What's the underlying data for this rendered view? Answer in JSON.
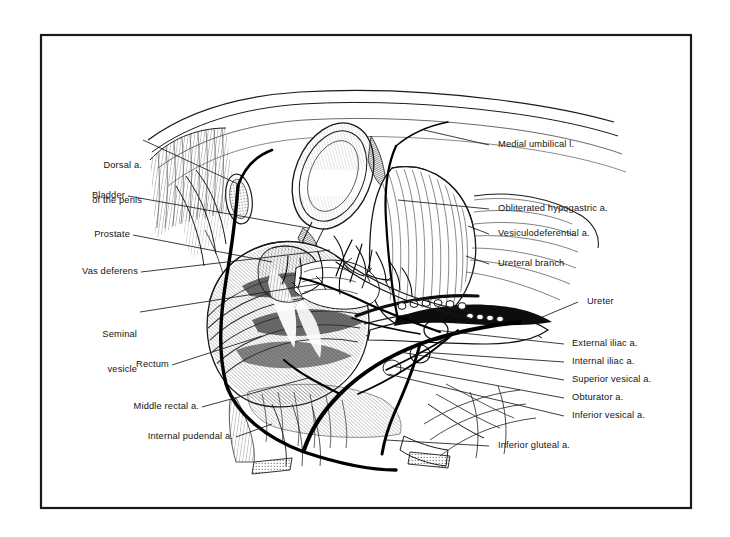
{
  "figure": {
    "kind": "anatomical-line-illustration",
    "frame": {
      "color": "#1a1a1a",
      "background": "#ffffff"
    },
    "ink": {
      "line": "#1a1a1a",
      "hatch": "#4a4a4a",
      "vessel": "#000000"
    }
  },
  "labels_left": [
    {
      "id": "dorsal-artery-of-penis",
      "text": "Dorsal a.\nof the penis",
      "lines": [
        "Dorsal a.",
        "of the penis"
      ]
    },
    {
      "id": "bladder",
      "text": "Bladder",
      "lines": [
        "Bladder"
      ]
    },
    {
      "id": "prostate",
      "text": "Prostate",
      "lines": [
        "Prostate"
      ]
    },
    {
      "id": "vas-deferens",
      "text": "Vas deferens",
      "lines": [
        "Vas deferens"
      ]
    },
    {
      "id": "seminal-vesicle",
      "text": "Seminal\nvesicle",
      "lines": [
        "Seminal",
        "vesicle"
      ]
    },
    {
      "id": "rectum",
      "text": "Rectum",
      "lines": [
        "Rectum"
      ]
    },
    {
      "id": "middle-rectal-artery",
      "text": "Middle rectal a.",
      "lines": [
        "Middle rectal a."
      ]
    },
    {
      "id": "internal-pudendal-artery",
      "text": "Internal pudendal a.",
      "lines": [
        "Internal pudendal a."
      ]
    }
  ],
  "labels_right": [
    {
      "id": "medial-umbilical-ligament",
      "text": "Medial umbilical l."
    },
    {
      "id": "obliterated-hypogastric-artery",
      "text": "Obliterated hypogastric a."
    },
    {
      "id": "vesiculodeferential-artery",
      "text": "Vesiculodeferential a."
    },
    {
      "id": "ureteral-branch",
      "text": "Ureteral branch"
    },
    {
      "id": "ureter",
      "text": "Ureter"
    },
    {
      "id": "external-iliac-artery",
      "text": "External iliac a."
    },
    {
      "id": "internal-iliac-artery",
      "text": "Internal iliac a."
    },
    {
      "id": "superior-vesical-artery",
      "text": "Superior vesical a."
    },
    {
      "id": "obturator-artery",
      "text": "Obturator a."
    },
    {
      "id": "inferior-vesical-artery",
      "text": "Inferior vesical a."
    },
    {
      "id": "inferior-gluteal-artery",
      "text": "Inferior gluteal a."
    }
  ]
}
